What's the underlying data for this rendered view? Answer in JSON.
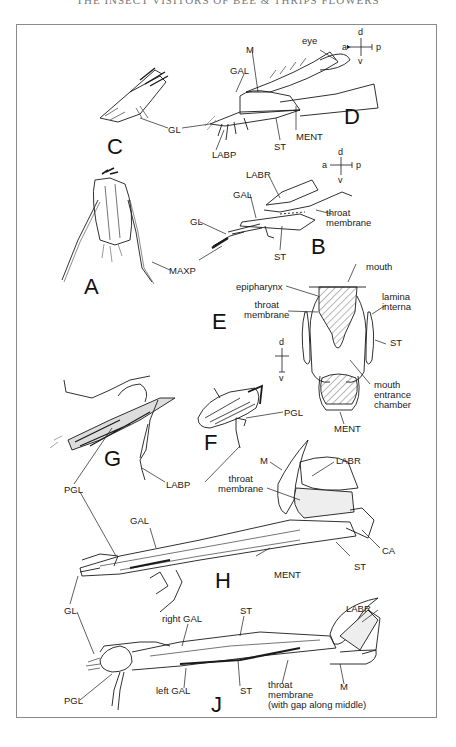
{
  "running_head": "THE INSECT VISITORS OF BEE & THRIPS FLOWERS",
  "figure": {
    "panels": [
      {
        "letter": "A",
        "labels": [
          "MAXP"
        ]
      },
      {
        "letter": "B",
        "labels": [
          "LABR",
          "GAL",
          "GL",
          "throat membrane",
          "ST"
        ]
      },
      {
        "letter": "C",
        "labels": [
          "GL"
        ]
      },
      {
        "letter": "D",
        "labels": [
          "eye",
          "M",
          "GAL",
          "MENT",
          "ST",
          "LABP"
        ]
      },
      {
        "letter": "E",
        "labels": [
          "mouth",
          "epipharynx",
          "throat membrane",
          "lamina interna",
          "ST",
          "mouth entrance chamber",
          "MENT"
        ]
      },
      {
        "letter": "F",
        "labels": [
          "PGL"
        ]
      },
      {
        "letter": "G",
        "labels": [
          "LABP",
          "PGL"
        ]
      },
      {
        "letter": "H",
        "labels": [
          "M",
          "LABR",
          "throat membrane",
          "GAL",
          "CA",
          "ST",
          "MENT",
          "PGL",
          "GL"
        ]
      },
      {
        "letter": "J",
        "labels": [
          "GL",
          "right GAL",
          "ST",
          "LABR",
          "PGL",
          "left GAL",
          "ST",
          "throat membrane (with gap along middle)",
          "M"
        ]
      }
    ],
    "orientation_keys": [
      {
        "near": "D",
        "a": "a",
        "p": "p",
        "d": "d",
        "v": "v"
      },
      {
        "near": "B",
        "a": "a",
        "p": "p",
        "d": "d",
        "v": "v"
      },
      {
        "near": "E",
        "d": "d",
        "v": "v"
      }
    ]
  },
  "letters": {
    "A": "A",
    "B": "B",
    "C": "C",
    "D": "D",
    "E": "E",
    "F": "F",
    "G": "G",
    "H": "H",
    "J": "J"
  },
  "labels": {
    "c_gl": "GL",
    "d_eye": "eye",
    "d_m": "M",
    "d_gal": "GAL",
    "d_ment": "MENT",
    "d_st": "ST",
    "d_labp": "LABP",
    "a_maxp": "MAXP",
    "b_labr": "LABR",
    "b_gal": "GAL",
    "b_gl": "GL",
    "b_throat": "throat\nmembrane",
    "b_st": "ST",
    "e_mouth": "mouth",
    "e_epi": "epipharynx",
    "e_throat": "throat\nmembrane",
    "e_lamina": "lamina\ninterna",
    "e_st": "ST",
    "e_chamber": "mouth\nentrance\nchamber",
    "e_ment": "MENT",
    "f_pgl": "PGL",
    "g_pgl": "PGL",
    "g_labp": "LABP",
    "h_m": "M",
    "h_labr": "LABR",
    "h_throat": "throat\nmembrane",
    "h_gal": "GAL",
    "h_ca": "CA",
    "h_st": "ST",
    "h_ment": "MENT",
    "h_gl": "GL",
    "j_rgal": "right GAL",
    "j_st1": "ST",
    "j_labr": "LABR",
    "j_pgl": "PGL",
    "j_lgal": "left GAL",
    "j_st2": "ST",
    "j_throat": "throat\nmembrane\n(with gap along middle)",
    "j_m": "M"
  },
  "axes": {
    "a": "a",
    "p": "p",
    "d": "d",
    "v": "v"
  }
}
